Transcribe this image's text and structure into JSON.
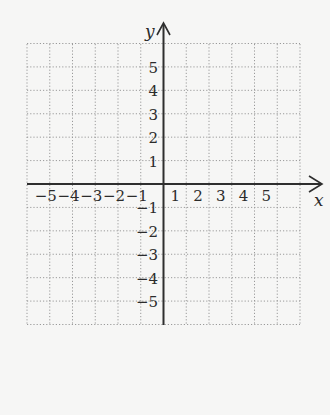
{
  "diagram": {
    "type": "coordinate-plane",
    "grid": {
      "x_min": -6,
      "x_max": 6,
      "y_min": -6,
      "y_max": 6,
      "step": 1,
      "line_style": "dotted",
      "line_color": "#9a9a9a"
    },
    "axes": {
      "color": "#2e2e2e",
      "x_label": "x",
      "y_label": "y"
    },
    "x_ticks": [
      {
        "value": -5,
        "label": "−5"
      },
      {
        "value": -4,
        "label": "−4"
      },
      {
        "value": -3,
        "label": "−3"
      },
      {
        "value": -2,
        "label": "−2"
      },
      {
        "value": -1,
        "label": "−1"
      },
      {
        "value": 1,
        "label": "1"
      },
      {
        "value": 2,
        "label": "2"
      },
      {
        "value": 3,
        "label": "3"
      },
      {
        "value": 4,
        "label": "4"
      },
      {
        "value": 5,
        "label": "5"
      }
    ],
    "y_ticks": [
      {
        "value": 5,
        "label": "5"
      },
      {
        "value": 4,
        "label": "4"
      },
      {
        "value": 3,
        "label": "3"
      },
      {
        "value": 2,
        "label": "2"
      },
      {
        "value": 1,
        "label": "1"
      },
      {
        "value": -1,
        "label": "−1"
      },
      {
        "value": -2,
        "label": "−2"
      },
      {
        "value": -3,
        "label": "−3"
      },
      {
        "value": -4,
        "label": "−4"
      },
      {
        "value": -5,
        "label": "−5"
      }
    ],
    "background": "#f6f6f5"
  }
}
